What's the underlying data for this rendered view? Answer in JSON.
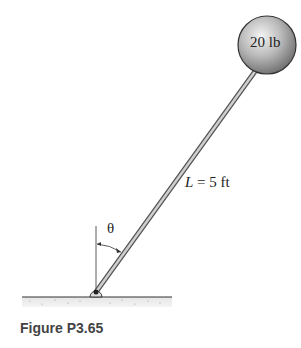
{
  "figure": {
    "caption": "Figure P3.65",
    "ball_label": "20 lb",
    "length_label_var": "L",
    "length_label_rest": " = 5 ft",
    "angle_label": "θ"
  }
}
